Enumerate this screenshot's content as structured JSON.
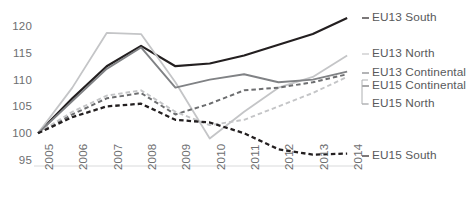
{
  "chart_data": {
    "type": "line",
    "title": "",
    "subtitle": "",
    "xlabel": "",
    "ylabel": "",
    "grid": false,
    "legend_position": "right",
    "x": [
      "2005",
      "2006",
      "2007",
      "2008",
      "2009",
      "2010",
      "2011",
      "2012",
      "2013",
      "2014"
    ],
    "categories": [
      "2005",
      "2006",
      "2007",
      "2008",
      "2009",
      "2010",
      "2011",
      "2012",
      "2013",
      "2014"
    ],
    "xlim": [
      2005,
      2014
    ],
    "ylim": [
      95,
      120
    ],
    "yticks": [
      "120",
      "115",
      "110",
      "105",
      "100",
      "95"
    ],
    "ytick_values": [
      120,
      115,
      110,
      105,
      100,
      95
    ],
    "series": [
      {
        "name": "EU13 South",
        "color": "#231f20",
        "style": "solid",
        "width": 2.2,
        "values": [
          100,
          106.5,
          112.5,
          116.3,
          112.5,
          113.0,
          114.5,
          116.5,
          118.5,
          121.5
        ]
      },
      {
        "name": "EU13 North",
        "color": "#c4c5c7",
        "style": "solid",
        "width": 1.8,
        "values": [
          100,
          108.5,
          118.7,
          118.5,
          109.5,
          99.0,
          104.0,
          108.5,
          110.5,
          114.5
        ]
      },
      {
        "name": "EU13 Continental",
        "color": "#808285",
        "style": "solid",
        "width": 1.9,
        "values": [
          100,
          106.0,
          112.0,
          116.0,
          108.5,
          110.0,
          111.0,
          109.5,
          110.0,
          111.5
        ]
      },
      {
        "name": "EU15 Continental",
        "color": "#6d6e70",
        "style": "dashed",
        "width": 2.0,
        "values": [
          100,
          103.5,
          106.5,
          107.5,
          103.5,
          105.5,
          108.0,
          108.5,
          109.5,
          111.0
        ]
      },
      {
        "name": "EU15 North",
        "color": "#c4c5c7",
        "style": "dashed",
        "width": 1.9,
        "values": [
          100,
          104.0,
          107.0,
          108.0,
          104.0,
          101.5,
          102.5,
          105.0,
          107.5,
          110.5
        ]
      },
      {
        "name": "EU15 South",
        "color": "#231f20",
        "style": "dashed",
        "width": 2.3,
        "values": [
          100,
          103.0,
          105.0,
          105.5,
          102.5,
          102.0,
          100.0,
          97.0,
          96.0,
          96.2
        ]
      }
    ]
  },
  "legend": {
    "items": [
      {
        "label": "EU13 South",
        "y": 11,
        "color": "#231f20"
      },
      {
        "label": "EU13 North",
        "y": 47,
        "color": "#c4c5c7"
      },
      {
        "label": "EU13 Continental",
        "y": 66,
        "color": "#808285"
      },
      {
        "label": "EU15 Continental",
        "y": 79,
        "color": "#6d6e70"
      },
      {
        "label": "EU15 North",
        "y": 97,
        "color": "#c4c5c7"
      },
      {
        "label": "EU15 South",
        "y": 149,
        "color": "#231f20"
      }
    ]
  },
  "axis": {
    "baseline_color": "#d9dadb"
  }
}
